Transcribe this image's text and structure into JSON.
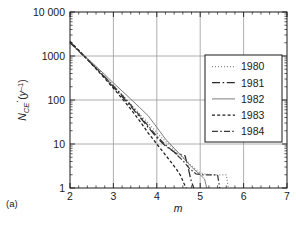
{
  "panel": {
    "label": "(a)"
  },
  "chart_data": {
    "type": "line",
    "title": "",
    "subtitle": "",
    "xlabel": "m",
    "ylabel": "ṄCE (y⁻¹)",
    "ylabel_parts": {
      "symbol": "N",
      "dot": "̇",
      "subscript": "CE",
      "units": "(y",
      "units_exponent": "–1",
      "units_close": ")"
    },
    "xlim": [
      2,
      7
    ],
    "ylim": [
      1,
      10000
    ],
    "yscale": "log",
    "xscale": "linear",
    "grid": true,
    "grid_axes": "both-major",
    "xticks": [
      2,
      3,
      4,
      5,
      6,
      7
    ],
    "xtick_labels": [
      "2",
      "3",
      "4",
      "5",
      "6",
      "7"
    ],
    "yticks": [
      1,
      10,
      100,
      1000,
      10000
    ],
    "ytick_labels": [
      "1",
      "10",
      "100",
      "1000",
      "10 000"
    ],
    "minor_ticks": true,
    "tick_direction": "in",
    "legend_position": "upper right",
    "series": [
      {
        "name": "1980",
        "style": "dotted",
        "color": "#8a8a8a",
        "points": [
          [
            2.0,
            2050
          ],
          [
            2.2,
            1380
          ],
          [
            2.4,
            880
          ],
          [
            2.6,
            560
          ],
          [
            2.8,
            350
          ],
          [
            3.0,
            215
          ],
          [
            3.2,
            132
          ],
          [
            3.4,
            80
          ],
          [
            3.6,
            49
          ],
          [
            3.8,
            30
          ],
          [
            4.0,
            18
          ],
          [
            4.2,
            11.5
          ],
          [
            4.4,
            7.5
          ],
          [
            4.6,
            5.0
          ],
          [
            4.8,
            3.2
          ],
          [
            5.0,
            2.2
          ],
          [
            5.2,
            2.0
          ],
          [
            5.4,
            2.0
          ],
          [
            5.6,
            2.0
          ],
          [
            5.65,
            1.0
          ]
        ]
      },
      {
        "name": "1981",
        "style": "long-dash-dot",
        "color": "#2a2a2a",
        "points": [
          [
            2.0,
            2100
          ],
          [
            2.2,
            1330
          ],
          [
            2.4,
            840
          ],
          [
            2.6,
            530
          ],
          [
            2.8,
            330
          ],
          [
            3.0,
            200
          ],
          [
            3.2,
            120
          ],
          [
            3.4,
            72
          ],
          [
            3.6,
            42
          ],
          [
            3.8,
            24
          ],
          [
            4.0,
            14
          ],
          [
            4.2,
            9.0
          ],
          [
            4.35,
            7.2
          ],
          [
            4.45,
            6.0
          ],
          [
            4.55,
            5.8
          ],
          [
            4.65,
            5.4
          ],
          [
            4.72,
            3.0
          ],
          [
            4.78,
            1.6
          ],
          [
            4.85,
            1.0
          ]
        ]
      },
      {
        "name": "1982",
        "style": "solid",
        "color": "#6f6f6f",
        "points": [
          [
            2.0,
            1950
          ],
          [
            2.2,
            1300
          ],
          [
            2.4,
            880
          ],
          [
            2.6,
            580
          ],
          [
            2.8,
            380
          ],
          [
            3.0,
            245
          ],
          [
            3.2,
            160
          ],
          [
            3.4,
            105
          ],
          [
            3.6,
            68
          ],
          [
            3.8,
            44
          ],
          [
            4.0,
            24
          ],
          [
            4.2,
            13
          ],
          [
            4.4,
            8.0
          ],
          [
            4.6,
            5.0
          ],
          [
            4.8,
            3.0
          ],
          [
            5.0,
            2.0
          ],
          [
            5.1,
            1.6
          ],
          [
            5.15,
            1.0
          ]
        ]
      },
      {
        "name": "1983",
        "style": "short-dash",
        "color": "#1e1e1e",
        "points": [
          [
            2.0,
            2150
          ],
          [
            2.2,
            1350
          ],
          [
            2.4,
            830
          ],
          [
            2.6,
            510
          ],
          [
            2.8,
            310
          ],
          [
            3.0,
            185
          ],
          [
            3.2,
            108
          ],
          [
            3.4,
            62
          ],
          [
            3.6,
            34
          ],
          [
            3.8,
            18
          ],
          [
            4.0,
            10
          ],
          [
            4.15,
            6.5
          ],
          [
            4.3,
            4.2
          ],
          [
            4.45,
            2.7
          ],
          [
            4.55,
            1.9
          ],
          [
            4.62,
            1.3
          ],
          [
            4.68,
            1.0
          ]
        ]
      },
      {
        "name": "1984",
        "style": "dash-dot",
        "color": "#3a3a3a",
        "points": [
          [
            2.0,
            2000
          ],
          [
            2.2,
            1290
          ],
          [
            2.4,
            830
          ],
          [
            2.6,
            530
          ],
          [
            2.8,
            335
          ],
          [
            3.0,
            210
          ],
          [
            3.2,
            128
          ],
          [
            3.4,
            77
          ],
          [
            3.6,
            45
          ],
          [
            3.8,
            26
          ],
          [
            4.0,
            15
          ],
          [
            4.2,
            9.5
          ],
          [
            4.4,
            6.5
          ],
          [
            4.6,
            4.2
          ],
          [
            4.75,
            2.8
          ],
          [
            4.9,
            2.1
          ],
          [
            5.05,
            2.0
          ],
          [
            5.25,
            2.0
          ],
          [
            5.4,
            2.0
          ],
          [
            5.45,
            1.0
          ]
        ]
      }
    ]
  },
  "legend": {
    "entries": [
      {
        "label": "1980",
        "style": "dotted"
      },
      {
        "label": "1981",
        "style": "long-dash-dot"
      },
      {
        "label": "1982",
        "style": "solid"
      },
      {
        "label": "1983",
        "style": "short-dash"
      },
      {
        "label": "1984",
        "style": "dash-dot"
      }
    ]
  },
  "colors": {
    "axis": "#1a1a1a",
    "grid": "#9a9a9a",
    "background": "#ffffff",
    "legend_border": "#1a1a1a"
  }
}
